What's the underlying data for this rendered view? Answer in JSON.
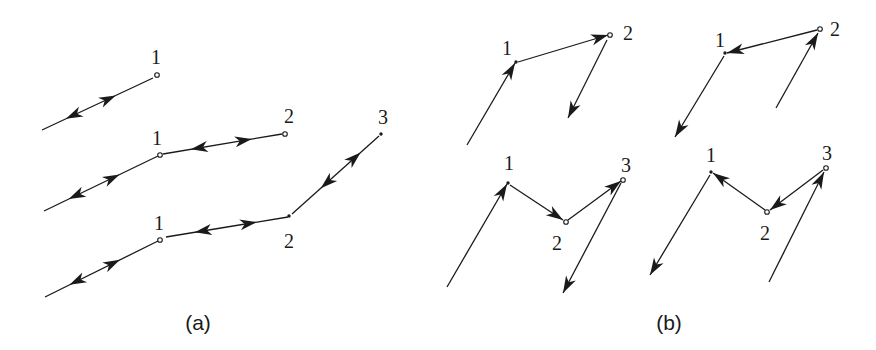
{
  "figure": {
    "panels": [
      {
        "id": "a",
        "caption": "(a)",
        "caption_pos": [
          198,
          330
        ],
        "groups": [
          {
            "name": "chain-one-node",
            "edges": [
              {
                "from": [
                  42,
                  130
                ],
                "to": [
                  153,
                  78
                ],
                "heads": [
                  {
                    "at": 0.6,
                    "dir": "forward"
                  },
                  {
                    "at": 0.28,
                    "dir": "backward"
                  }
                ]
              }
            ],
            "nodes": [
              {
                "label": "1",
                "pos": [
                  157,
                  75
                ],
                "style": "open",
                "label_pos": [
                  156,
                  64
                ]
              }
            ]
          },
          {
            "name": "chain-two-nodes",
            "edges": [
              {
                "from": [
                  44,
                  211
                ],
                "to": [
                  158,
                  156
                ],
                "heads": [
                  {
                    "at": 0.6,
                    "dir": "forward"
                  },
                  {
                    "at": 0.28,
                    "dir": "backward"
                  }
                ]
              },
              {
                "from": [
                  163,
                  154
                ],
                "to": [
                  282,
                  134
                ],
                "heads": [
                  {
                    "at": 0.3,
                    "dir": "backward"
                  },
                  {
                    "at": 0.68,
                    "dir": "forward"
                  }
                ]
              }
            ],
            "nodes": [
              {
                "label": "1",
                "pos": [
                  160,
                  155
                ],
                "style": "open",
                "label_pos": [
                  157,
                  145
                ]
              },
              {
                "label": "2",
                "pos": [
                  285,
                  134
                ],
                "style": "open",
                "label_pos": [
                  289,
                  123
                ]
              }
            ]
          },
          {
            "name": "chain-three-nodes",
            "edges": [
              {
                "from": [
                  45,
                  297
                ],
                "to": [
                  158,
                  241
                ],
                "heads": [
                  {
                    "at": 0.6,
                    "dir": "forward"
                  },
                  {
                    "at": 0.28,
                    "dir": "backward"
                  }
                ]
              },
              {
                "from": [
                  166,
                  237
                ],
                "to": [
                  288,
                  217
                ],
                "heads": [
                  {
                    "at": 0.3,
                    "dir": "backward"
                  },
                  {
                    "at": 0.68,
                    "dir": "forward"
                  }
                ]
              },
              {
                "from": [
                  292,
                  214
                ],
                "to": [
                  379,
                  136
                ],
                "heads": [
                  {
                    "at": 0.4,
                    "dir": "backward"
                  },
                  {
                    "at": 0.72,
                    "dir": "forward"
                  }
                ]
              }
            ],
            "nodes": [
              {
                "label": "1",
                "pos": [
                  160,
                  240
                ],
                "style": "open",
                "label_pos": [
                  159,
                  230
                ]
              },
              {
                "label": "2",
                "pos": [
                  289,
                  216
                ],
                "style": "dot",
                "label_pos": [
                  289,
                  248
                ]
              },
              {
                "label": "3",
                "pos": [
                  381,
                  134
                ],
                "style": "dot",
                "label_pos": [
                  383,
                  124
                ]
              }
            ]
          }
        ]
      },
      {
        "id": "b",
        "caption": "(b)",
        "caption_pos": [
          669,
          330
        ],
        "groups": [
          {
            "name": "cycle-top-left",
            "edges": [
              {
                "from": [
                  467,
                  145
                ],
                "to": [
                  515,
                  63
                ],
                "heads": [
                  {
                    "at": 1.0,
                    "dir": "forward"
                  }
                ]
              },
              {
                "from": [
                  518,
                  62
                ],
                "to": [
                  608,
                  35
                ],
                "heads": [
                  {
                    "at": 1.0,
                    "dir": "forward"
                  }
                ]
              },
              {
                "from": [
                  607,
                  40
                ],
                "to": [
                  568,
                  118
                ],
                "heads": [
                  {
                    "at": 1.0,
                    "dir": "forward"
                  }
                ]
              }
            ],
            "nodes": [
              {
                "label": "1",
                "pos": [
                  516,
                  62
                ],
                "style": "dot",
                "label_pos": [
                  507,
                  55
                ]
              },
              {
                "label": "2",
                "pos": [
                  610,
                  35
                ],
                "style": "open",
                "label_pos": [
                  628,
                  40
                ]
              }
            ]
          },
          {
            "name": "cycle-top-right",
            "edges": [
              {
                "from": [
                  817,
                  30
                ],
                "to": [
                  727,
                  53
                ],
                "heads": [
                  {
                    "at": 1.0,
                    "dir": "forward"
                  }
                ]
              },
              {
                "from": [
                  724,
                  56
                ],
                "to": [
                  675,
                  137
                ],
                "heads": [
                  {
                    "at": 1.0,
                    "dir": "forward"
                  }
                ]
              },
              {
                "from": [
                  776,
                  108
                ],
                "to": [
                  818,
                  33
                ],
                "heads": [
                  {
                    "at": 1.0,
                    "dir": "forward"
                  }
                ]
              }
            ],
            "nodes": [
              {
                "label": "1",
                "pos": [
                  725,
                  53
                ],
                "style": "dot",
                "label_pos": [
                  720,
                  47
                ]
              },
              {
                "label": "2",
                "pos": [
                  820,
                  29
                ],
                "style": "open",
                "label_pos": [
                  835,
                  36
                ]
              }
            ]
          },
          {
            "name": "cycle-bottom-left",
            "edges": [
              {
                "from": [
                  447,
                  287
                ],
                "to": [
                  507,
                  184
                ],
                "heads": [
                  {
                    "at": 1.0,
                    "dir": "forward"
                  }
                ]
              },
              {
                "from": [
                  510,
                  185
                ],
                "to": [
                  563,
                  220
                ],
                "heads": [
                  {
                    "at": 1.0,
                    "dir": "forward"
                  }
                ]
              },
              {
                "from": [
                  568,
                  220
                ],
                "to": [
                  621,
                  181
                ],
                "heads": [
                  {
                    "at": 1.0,
                    "dir": "forward"
                  }
                ]
              },
              {
                "from": [
                  621,
                  183
                ],
                "to": [
                  563,
                  293
                ],
                "heads": [
                  {
                    "at": 1.0,
                    "dir": "forward"
                  }
                ]
              }
            ],
            "nodes": [
              {
                "label": "1",
                "pos": [
                  508,
                  183
                ],
                "style": "dot",
                "label_pos": [
                  509,
                  170
                ]
              },
              {
                "label": "2",
                "pos": [
                  566,
                  222
                ],
                "style": "open",
                "label_pos": [
                  557,
                  250
                ]
              },
              {
                "label": "3",
                "pos": [
                  623,
                  180
                ],
                "style": "open",
                "label_pos": [
                  626,
                  172
                ]
              }
            ]
          },
          {
            "name": "cycle-bottom-right",
            "edges": [
              {
                "from": [
                  765,
                  210
                ],
                "to": [
                  713,
                  173
                ],
                "heads": [
                  {
                    "at": 1.0,
                    "dir": "forward"
                  }
                ]
              },
              {
                "from": [
                  710,
                  175
                ],
                "to": [
                  650,
                  275
                ],
                "heads": [
                  {
                    "at": 1.0,
                    "dir": "forward"
                  }
                ]
              },
              {
                "from": [
                  823,
                  170
                ],
                "to": [
                  770,
                  210
                ],
                "heads": [
                  {
                    "at": 1.0,
                    "dir": "forward"
                  }
                ]
              },
              {
                "from": [
                  769,
                  282
                ],
                "to": [
                  824,
                  172
                ],
                "heads": [
                  {
                    "at": 1.0,
                    "dir": "forward"
                  }
                ]
              }
            ],
            "nodes": [
              {
                "label": "1",
                "pos": [
                  711,
                  172
                ],
                "style": "dot",
                "label_pos": [
                  711,
                  162
                ]
              },
              {
                "label": "2",
                "pos": [
                  767,
                  212
                ],
                "style": "open",
                "label_pos": [
                  765,
                  240
                ]
              },
              {
                "label": "3",
                "pos": [
                  826,
                  168
                ],
                "style": "open",
                "label_pos": [
                  827,
                  160
                ]
              }
            ]
          }
        ]
      }
    ]
  }
}
